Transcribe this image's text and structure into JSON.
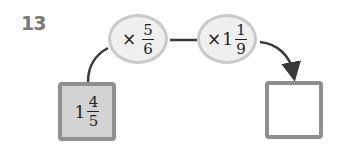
{
  "problem_number": "13",
  "start_value": {
    "whole": "1",
    "numerator": "4",
    "denominator": "5"
  },
  "operations": [
    {
      "operator": "×",
      "whole": "",
      "numerator": "5",
      "denominator": "6"
    },
    {
      "operator": "×",
      "whole": "1",
      "numerator": "1",
      "denominator": "9"
    }
  ],
  "answer_box": {
    "value": ""
  },
  "colors": {
    "number_gray": "#7a7a7a",
    "given_box_fill": "#d3d3d3",
    "box_border": "#8f8f8f",
    "oval_fill": "#efefef",
    "oval_border": "#c9c9c9",
    "line": "#3a3a3a"
  }
}
